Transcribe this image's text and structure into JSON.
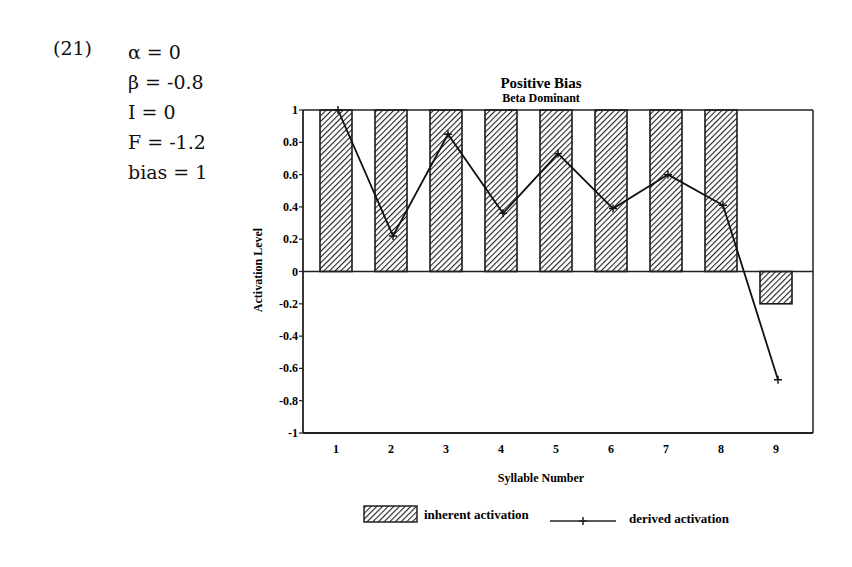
{
  "example": {
    "number": "(21)",
    "params": [
      {
        "name": "α",
        "value": "0"
      },
      {
        "name": "β",
        "value": "-0.8"
      },
      {
        "name": "I",
        "value": "0"
      },
      {
        "name": "F",
        "value": "-1.2"
      },
      {
        "name": "bias",
        "value": "1"
      }
    ]
  },
  "chart_data": {
    "type": "bar",
    "title": "Positive Bias",
    "subtitle": "Beta Dominant",
    "xlabel": "Syllable Number",
    "ylabel": "Activation Level",
    "categories": [
      "1",
      "2",
      "3",
      "4",
      "5",
      "6",
      "7",
      "8",
      "9"
    ],
    "ylim": [
      -1,
      1
    ],
    "yticks": [
      "1",
      "0.8",
      "0.6",
      "0.4",
      "0.2",
      "0",
      "-0.2",
      "-0.4",
      "-0.6",
      "-0.8",
      "-1"
    ],
    "ytick_values": [
      1,
      0.8,
      0.6,
      0.4,
      0.2,
      0,
      -0.2,
      -0.4,
      -0.6,
      -0.8,
      -1
    ],
    "grid": false,
    "legend_position": "bottom",
    "series": [
      {
        "name": "inherent activation",
        "kind": "bar",
        "pattern": "hatched",
        "values": [
          1,
          1,
          1,
          1,
          1,
          1,
          1,
          1,
          -0.2
        ]
      },
      {
        "name": "derived activation",
        "kind": "line",
        "marker": "+",
        "values": [
          1,
          0.22,
          0.85,
          0.36,
          0.73,
          0.39,
          0.6,
          0.41,
          -0.67
        ]
      }
    ]
  }
}
